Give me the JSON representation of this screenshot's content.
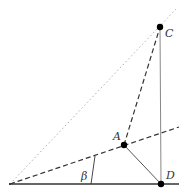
{
  "diagram": {
    "type": "geometry",
    "colors": {
      "background": "#ffffff",
      "line": "#333333",
      "light_line": "#999999",
      "dotted_line": "#b0b0b0",
      "point": "#000000"
    },
    "points": {
      "O": {
        "x": 10,
        "y": 184,
        "label": ""
      },
      "A": {
        "x": 124,
        "y": 145,
        "label": "A"
      },
      "C": {
        "x": 160,
        "y": 27,
        "label": "C"
      },
      "D": {
        "x": 161,
        "y": 184,
        "label": "D"
      }
    },
    "angle": {
      "label": "β",
      "vertex": "O"
    },
    "segments": [
      {
        "from": "O",
        "to": "extended",
        "style": "solid",
        "description": "baseline"
      },
      {
        "from": "O",
        "to": "A",
        "style": "dashed",
        "description": "ray through A"
      },
      {
        "from": "O",
        "to": "C",
        "style": "dotted",
        "description": "ray through C"
      },
      {
        "from": "A",
        "to": "C",
        "style": "dashed"
      },
      {
        "from": "C",
        "to": "D",
        "style": "solid-thin"
      },
      {
        "from": "A",
        "to": "D",
        "style": "solid-thin"
      }
    ]
  }
}
